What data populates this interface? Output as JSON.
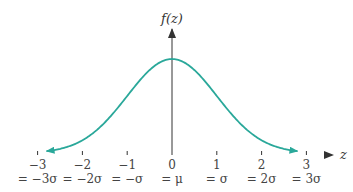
{
  "chart_data": {
    "type": "line",
    "xlabel": "z",
    "ylabel": "f(z)",
    "x_ticks": [
      -3,
      -2,
      -1,
      0,
      1,
      2,
      3
    ],
    "tick_labels": [
      "−3",
      "−2",
      "−1",
      "0",
      "1",
      "2",
      "3"
    ],
    "sigma_labels": [
      "= −3σ",
      "= −2σ",
      "= −σ",
      "= μ",
      "= σ",
      "= 2σ",
      "= 3σ"
    ],
    "series": [
      {
        "name": "f(z)",
        "function": "standard normal pdf",
        "x": [
          -2.8,
          -2,
          -1,
          0,
          1,
          2,
          2.8
        ],
        "values": [
          0.0079,
          0.054,
          0.242,
          0.399,
          0.242,
          0.054,
          0.0079
        ]
      }
    ],
    "xlim": [
      -3.5,
      3.6
    ],
    "grid": false,
    "legend": "none",
    "colors": {
      "curve": "#2aa89a",
      "axis": "#333333",
      "axis_left": "#5a4fcf"
    }
  }
}
